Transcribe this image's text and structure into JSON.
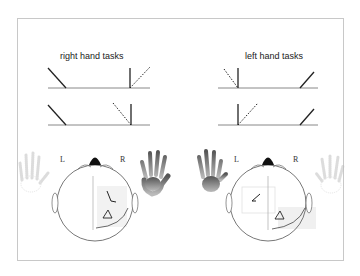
{
  "panels": [
    {
      "title": "right hand tasks",
      "rows": [
        {
          "left": "solid-diagonal-down",
          "right": "vertical-with-dotted-diagonal-right"
        },
        {
          "left": "solid-diagonal-down",
          "right": "vertical-with-dotted-diagonal-left"
        }
      ],
      "head": {
        "left_label": "L",
        "right_label": "R",
        "active_hand": "right",
        "highlight_quadrant": "right",
        "symbols": [
          "line-symbol",
          "triangle-symbol"
        ]
      }
    },
    {
      "title": "left hand tasks",
      "rows": [
        {
          "left": "vertical-with-dotted-diagonal-left",
          "right": "solid-diagonal-up"
        },
        {
          "left": "vertical-with-dotted-diagonal-right",
          "right": "solid-diagonal-up"
        }
      ],
      "head": {
        "left_label": "L",
        "right_label": "R",
        "active_hand": "left",
        "highlight_quadrant": "left",
        "symbols": [
          "line-symbol",
          "triangle-symbol"
        ]
      }
    }
  ],
  "colors": {
    "line": "#222222",
    "baseline": "#888888",
    "frame": "#c8c8c8",
    "hand_active": "#777777",
    "hand_inactive": "#dddddd",
    "highlight": "#efefef"
  }
}
